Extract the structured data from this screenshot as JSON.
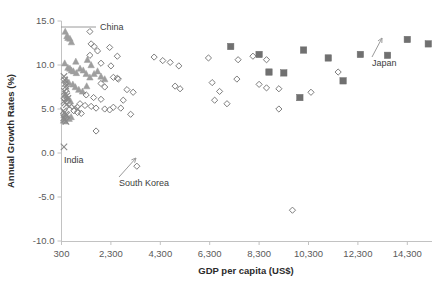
{
  "chart_data": {
    "type": "scatter",
    "title": "",
    "xlabel": "GDP per capita (US$)",
    "ylabel": "Annual Growth Rates (%)",
    "xlim": [
      300,
      15300
    ],
    "ylim": [
      -10.0,
      15.0
    ],
    "grid": false,
    "legend": "none",
    "xticks": [
      300,
      2300,
      4300,
      6300,
      8300,
      10300,
      12300,
      14300
    ],
    "xtick_labels": [
      "300",
      "2,300",
      "4,300",
      "6,300",
      "8,300",
      "10,300",
      "12,300",
      "14,300"
    ],
    "yticks": [
      -10.0,
      -5.0,
      0.0,
      5.0,
      10.0,
      15.0
    ],
    "ytick_labels": [
      "-10.0",
      "-5.0",
      "0.0",
      "5.0",
      "10.0",
      "15.0"
    ],
    "colors": {
      "triangle": "#9e9e9e",
      "diamond_stroke": "#7d7d7d",
      "square": "#707070",
      "cross": "#8a8a8a",
      "axis": "#c2c2c2",
      "text": "#3d3d3d"
    },
    "series": [
      {
        "name": "triangles",
        "marker": "triangle",
        "fill": "#9e9e9e",
        "points": [
          [
            450,
            13.8
          ],
          [
            520,
            13.3
          ],
          [
            560,
            13.1
          ],
          [
            640,
            13.0
          ],
          [
            700,
            12.6
          ],
          [
            430,
            10.2
          ],
          [
            880,
            10.4
          ],
          [
            1350,
            10.6
          ],
          [
            1500,
            10.0
          ],
          [
            560,
            9.7
          ],
          [
            640,
            9.6
          ],
          [
            700,
            9.4
          ],
          [
            780,
            9.3
          ],
          [
            900,
            9.1
          ],
          [
            1050,
            9.6
          ],
          [
            1180,
            9.4
          ],
          [
            1300,
            9.0
          ],
          [
            1450,
            8.6
          ],
          [
            1620,
            9.0
          ],
          [
            1760,
            9.3
          ],
          [
            1900,
            8.7
          ],
          [
            2050,
            8.4
          ],
          [
            500,
            8.3
          ],
          [
            600,
            8.0
          ],
          [
            760,
            7.8
          ],
          [
            860,
            7.5
          ],
          [
            1000,
            7.2
          ],
          [
            1150,
            7.0
          ],
          [
            1320,
            7.6
          ],
          [
            420,
            6.6
          ],
          [
            520,
            6.2
          ],
          [
            660,
            5.9
          ],
          [
            400,
            4.3
          ],
          [
            470,
            4.2
          ],
          [
            540,
            4.0
          ],
          [
            610,
            3.9
          ],
          [
            690,
            4.1
          ],
          [
            380,
            3.7
          ],
          [
            450,
            3.6
          ]
        ]
      },
      {
        "name": "open-diamonds",
        "marker": "diamond",
        "fill": "none",
        "points": [
          [
            1450,
            13.8
          ],
          [
            1500,
            12.4
          ],
          [
            1620,
            12.1
          ],
          [
            1760,
            11.6
          ],
          [
            2250,
            12.0
          ],
          [
            2560,
            11.0
          ],
          [
            4050,
            10.9
          ],
          [
            4400,
            10.5
          ],
          [
            4700,
            10.3
          ],
          [
            5050,
            9.9
          ],
          [
            6250,
            10.8
          ],
          [
            7450,
            10.6
          ],
          [
            8050,
            11.0
          ],
          [
            8600,
            10.6
          ],
          [
            1450,
            11.1
          ],
          [
            1900,
            10.2
          ],
          [
            2300,
            9.9
          ],
          [
            2400,
            8.6
          ],
          [
            2560,
            8.5
          ],
          [
            2600,
            8.4
          ],
          [
            1900,
            7.9
          ],
          [
            2050,
            7.5
          ],
          [
            2950,
            7.2
          ],
          [
            3200,
            6.9
          ],
          [
            4900,
            7.6
          ],
          [
            5100,
            7.3
          ],
          [
            6400,
            8.0
          ],
          [
            6700,
            7.0
          ],
          [
            7400,
            8.4
          ],
          [
            8300,
            7.8
          ],
          [
            8600,
            7.4
          ],
          [
            9100,
            7.3
          ],
          [
            10400,
            6.9
          ],
          [
            11500,
            9.2
          ],
          [
            1300,
            6.6
          ],
          [
            1600,
            6.3
          ],
          [
            1900,
            6.1
          ],
          [
            2800,
            6.0
          ],
          [
            1050,
            5.6
          ],
          [
            1250,
            5.4
          ],
          [
            1500,
            5.3
          ],
          [
            1700,
            5.1
          ],
          [
            2050,
            5.0
          ],
          [
            2250,
            4.9
          ],
          [
            2400,
            5.2
          ],
          [
            2700,
            5.1
          ],
          [
            800,
            4.8
          ],
          [
            950,
            4.6
          ],
          [
            1100,
            4.5
          ],
          [
            3100,
            4.4
          ],
          [
            6500,
            6.0
          ],
          [
            7000,
            5.6
          ],
          [
            9100,
            5.0
          ],
          [
            1700,
            2.5
          ],
          [
            3350,
            -1.5
          ],
          [
            9650,
            -6.5
          ]
        ]
      },
      {
        "name": "crosses",
        "marker": "cross",
        "fill": "#8a8a8a",
        "points": [
          [
            400,
            8.7
          ],
          [
            430,
            8.3
          ],
          [
            450,
            7.9
          ],
          [
            480,
            7.6
          ],
          [
            500,
            7.3
          ],
          [
            420,
            7.0
          ],
          [
            460,
            6.7
          ],
          [
            520,
            6.5
          ],
          [
            560,
            6.2
          ],
          [
            400,
            5.9
          ],
          [
            440,
            5.7
          ],
          [
            500,
            5.5
          ],
          [
            620,
            5.3
          ],
          [
            820,
            5.2
          ],
          [
            960,
            5.0
          ],
          [
            380,
            4.8
          ],
          [
            420,
            4.6
          ],
          [
            470,
            4.4
          ],
          [
            520,
            4.3
          ],
          [
            390,
            4.0
          ],
          [
            430,
            3.8
          ],
          [
            480,
            3.6
          ],
          [
            400,
            0.7
          ]
        ]
      },
      {
        "name": "filled-squares",
        "marker": "square",
        "fill": "#707070",
        "points": [
          [
            7150,
            12.1
          ],
          [
            8300,
            11.2
          ],
          [
            8700,
            9.2
          ],
          [
            9300,
            9.1
          ],
          [
            10100,
            11.7
          ],
          [
            11100,
            10.8
          ],
          [
            11700,
            8.2
          ],
          [
            12400,
            11.2
          ],
          [
            13500,
            11.1
          ],
          [
            14300,
            12.9
          ],
          [
            15150,
            12.4
          ],
          [
            9950,
            6.3
          ]
        ]
      }
    ],
    "annotations": [
      {
        "text": "China",
        "type": "leader-line",
        "label_x": 100,
        "label_y": 30,
        "anchor_x": 61,
        "anchor_y": 27
      },
      {
        "text": "Japan",
        "type": "arrow",
        "label_x": 372,
        "label_y": 66,
        "anchor_x": 382,
        "anchor_y": 38
      },
      {
        "text": "India",
        "type": "plain",
        "label_x": 64,
        "label_y": 163,
        "anchor_x": 60,
        "anchor_y": 146
      },
      {
        "text": "South Korea",
        "type": "arrow",
        "label_x": 119,
        "label_y": 186,
        "anchor_x": 136,
        "anchor_y": 158
      }
    ]
  }
}
